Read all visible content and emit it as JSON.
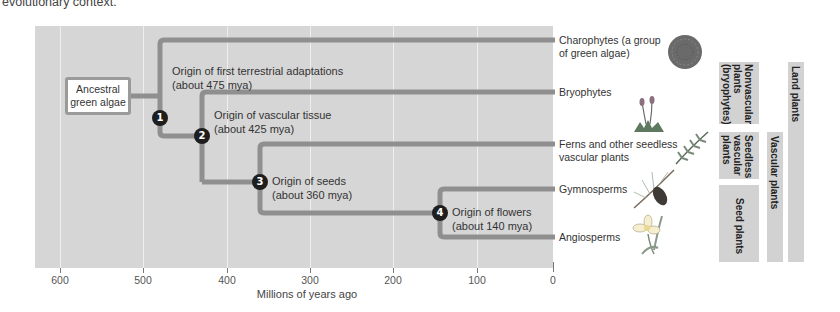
{
  "caption": "evolutionary context.",
  "axis": {
    "title": "Millions of years ago",
    "ticks": [
      "600",
      "500",
      "400",
      "300",
      "200",
      "100",
      "0"
    ]
  },
  "ancestor": {
    "label": "Ancestral green algae"
  },
  "events": [
    {
      "number": "1",
      "title": "Origin of first terrestrial adaptations",
      "date": "(about 475 mya)"
    },
    {
      "number": "2",
      "title": "Origin of vascular tissue",
      "date": "(about 425 mya)"
    },
    {
      "number": "3",
      "title": "Origin of seeds",
      "date": "(about 360 mya)"
    },
    {
      "number": "4",
      "title": "Origin of flowers",
      "date": "(about 140 mya)"
    }
  ],
  "taxa": [
    {
      "name": "Charophytes (a group of green algae)",
      "icon": "charophyte-icon"
    },
    {
      "name": "Bryophytes",
      "icon": "moss-icon"
    },
    {
      "name": "Ferns and other seedless vascular plants",
      "icon": "fern-icon"
    },
    {
      "name": "Gymnosperms",
      "icon": "pine-cone-icon"
    },
    {
      "name": "Angiosperms",
      "icon": "flower-icon"
    }
  ],
  "groups": {
    "nonvascular": "Nonvascular\nplants\n(bryophytes)",
    "seedless": "Seedless\nvascular\nplants",
    "seed": "Seed plants",
    "vascular": "Vascular plants",
    "land": "Land plants"
  },
  "colors": {
    "panel": "#d6d6d6",
    "branch": "#8f8f8f",
    "node": "#1e1e1e",
    "group_box": "#d2d2d2"
  }
}
